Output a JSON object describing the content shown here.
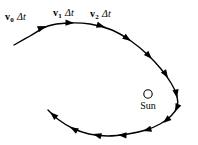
{
  "figure": {
    "kind": "orbit-diagram",
    "width": 198,
    "height": 145,
    "background_color": "#ffffff",
    "stroke_color": "#000000",
    "title": ""
  },
  "labels": {
    "v0": {
      "symbol": "v",
      "subscript": "0",
      "delta_t": "Δt"
    },
    "v1": {
      "symbol": "v",
      "subscript": "1",
      "delta_t": "Δt"
    },
    "v2": {
      "symbol": "v",
      "subscript": "2",
      "delta_t": "Δt"
    }
  },
  "sun": {
    "label": "Sun",
    "marker": "open-circle",
    "cx": 148,
    "cy": 94,
    "r": 4.2
  },
  "chart_data": {
    "type": "line",
    "title": "",
    "xlabel": "",
    "ylabel": "",
    "xlim": [
      0,
      198
    ],
    "ylim": [
      0,
      145
    ],
    "grid": false,
    "legend": null,
    "series": [
      {
        "name": "orbit-path",
        "closed": false,
        "points": [
          [
            14,
            45
          ],
          [
            30,
            36
          ],
          [
            48,
            26
          ],
          [
            68,
            23
          ],
          [
            90,
            24
          ],
          [
            112,
            30
          ],
          [
            131,
            41
          ],
          [
            148,
            55
          ],
          [
            161,
            69
          ],
          [
            171,
            83
          ],
          [
            177,
            96
          ],
          [
            177,
            107
          ],
          [
            171,
            116
          ],
          [
            160,
            124
          ],
          [
            146,
            130
          ],
          [
            128,
            134
          ],
          [
            108,
            136
          ],
          [
            89,
            134
          ],
          [
            72,
            128
          ],
          [
            59,
            120
          ],
          [
            48,
            110
          ]
        ]
      }
    ],
    "arrowheads": [
      {
        "index": 0,
        "x": 46,
        "y": 26,
        "angle_deg": -22
      },
      {
        "index": 1,
        "x": 74,
        "y": 23,
        "angle_deg": 2
      },
      {
        "index": 2,
        "x": 105,
        "y": 27,
        "angle_deg": 16
      },
      {
        "index": 3,
        "x": 131,
        "y": 41,
        "angle_deg": 34
      },
      {
        "index": 4,
        "x": 152,
        "y": 59,
        "angle_deg": 46
      },
      {
        "index": 5,
        "x": 168,
        "y": 78,
        "angle_deg": 58
      },
      {
        "index": 6,
        "x": 177,
        "y": 98,
        "angle_deg": 80
      },
      {
        "index": 7,
        "x": 175,
        "y": 112,
        "angle_deg": 114
      },
      {
        "index": 8,
        "x": 163,
        "y": 123,
        "angle_deg": 140
      },
      {
        "index": 9,
        "x": 143,
        "y": 131,
        "angle_deg": 164
      },
      {
        "index": 10,
        "x": 118,
        "y": 135,
        "angle_deg": 182
      },
      {
        "index": 11,
        "x": 93,
        "y": 134,
        "angle_deg": 195
      },
      {
        "index": 12,
        "x": 70,
        "y": 127,
        "angle_deg": 209
      },
      {
        "index": 13,
        "x": 50,
        "y": 112,
        "angle_deg": 222
      }
    ]
  },
  "label_positions": {
    "v0": {
      "x": 5,
      "y": 12
    },
    "v1": {
      "x": 53,
      "y": 8
    },
    "v2": {
      "x": 90,
      "y": 9
    },
    "sun_text": {
      "x": 133,
      "y": 101
    }
  }
}
